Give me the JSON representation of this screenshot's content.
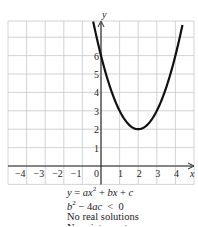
{
  "chart_data": {
    "type": "line",
    "title": "",
    "xlabel": "x",
    "ylabel": "y",
    "xlim": [
      -5,
      5
    ],
    "ylim": [
      -1,
      7.8
    ],
    "grid": true,
    "x_ticks": [
      "−4",
      "−3",
      "−2",
      "−1",
      "0",
      "1",
      "2",
      "3",
      "4"
    ],
    "y_ticks": [
      "1",
      "2",
      "3",
      "4",
      "5",
      "6"
    ],
    "series": [
      {
        "name": "parabola",
        "equation": "y = x^2 - 4x + 6",
        "vertex": [
          2,
          2
        ],
        "y_intercept": 6,
        "x": [
          -0.4,
          0,
          0.5,
          1,
          1.5,
          2,
          2.5,
          3,
          3.5,
          4,
          4.4
        ],
        "values": [
          7.76,
          6,
          4.25,
          3,
          2.25,
          2,
          2.25,
          3,
          4.25,
          6,
          7.76
        ]
      }
    ],
    "annotations": [
      "y = ax² + bx + c",
      "b² − 4ac < 0",
      "No real solutions",
      "No x-intercepts"
    ]
  },
  "labels": {
    "x_axis": "x",
    "y_axis": "y"
  },
  "caption": {
    "line1_a": "y",
    "line1_b": " = ",
    "line1_c": "ax",
    "line1_d": "2",
    "line1_e": " + ",
    "line1_f": "bx",
    "line1_g": " + ",
    "line1_h": "c",
    "line2_a": "b",
    "line2_b": "2",
    "line2_c": " − 4",
    "line2_d": "ac",
    "line2_e": "  <  0",
    "line3": "No real solutions",
    "line4_a": "No ",
    "line4_b": "x",
    "line4_c": "-intercepts"
  }
}
